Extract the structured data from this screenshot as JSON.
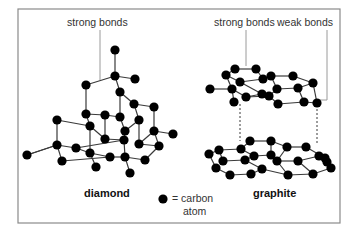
{
  "labels": {
    "diamond_strong_bonds": "strong bonds",
    "graphite_strong_bonds": "strong bonds",
    "graphite_weak_bonds": "weak bonds",
    "diamond_title": "diamond",
    "graphite_title": "graphite",
    "legend_line1": "= carbon",
    "legend_line2": "atom"
  },
  "colors": {
    "atom": "#000000",
    "bond": "#3a3a3a",
    "frame": "#8a8a8a",
    "leader": "#9a9a9a"
  },
  "frame": {
    "x": 18,
    "y": 9,
    "w": 322,
    "h": 214
  },
  "diamond": {
    "atoms": [
      [
        115,
        50
      ],
      [
        115,
        76
      ],
      [
        135,
        79
      ],
      [
        86,
        85
      ],
      [
        120,
        92
      ],
      [
        134,
        104
      ],
      [
        154,
        107
      ],
      [
        57,
        120
      ],
      [
        86,
        114
      ],
      [
        105,
        115
      ],
      [
        120,
        117
      ],
      [
        139,
        120
      ],
      [
        90,
        126
      ],
      [
        125,
        131
      ],
      [
        154,
        131
      ],
      [
        105,
        139
      ],
      [
        124,
        140
      ],
      [
        139,
        144
      ],
      [
        173,
        134
      ],
      [
        57,
        145
      ],
      [
        76,
        148
      ],
      [
        90,
        153
      ],
      [
        27,
        155
      ],
      [
        159,
        146
      ],
      [
        62,
        161
      ],
      [
        110,
        157
      ],
      [
        125,
        157
      ],
      [
        145,
        160
      ],
      [
        96,
        167
      ],
      [
        130,
        173
      ]
    ],
    "bonds": [
      [
        0,
        1
      ],
      [
        1,
        2
      ],
      [
        1,
        3
      ],
      [
        1,
        4
      ],
      [
        3,
        8
      ],
      [
        4,
        5
      ],
      [
        5,
        6
      ],
      [
        5,
        11
      ],
      [
        6,
        14
      ],
      [
        8,
        9
      ],
      [
        9,
        10
      ],
      [
        10,
        4
      ],
      [
        8,
        12
      ],
      [
        9,
        15
      ],
      [
        10,
        13
      ],
      [
        11,
        13
      ],
      [
        11,
        17
      ],
      [
        12,
        7
      ],
      [
        7,
        19
      ],
      [
        19,
        20
      ],
      [
        19,
        22
      ],
      [
        19,
        24
      ],
      [
        20,
        21
      ],
      [
        21,
        12
      ],
      [
        21,
        28
      ],
      [
        15,
        16
      ],
      [
        16,
        13
      ],
      [
        16,
        26
      ],
      [
        17,
        23
      ],
      [
        14,
        18
      ],
      [
        14,
        23
      ],
      [
        23,
        27
      ],
      [
        26,
        25
      ],
      [
        26,
        29
      ],
      [
        25,
        21
      ],
      [
        27,
        26
      ],
      [
        24,
        25
      ],
      [
        12,
        15
      ],
      [
        17,
        14
      ],
      [
        20,
        16
      ],
      [
        22,
        19
      ]
    ]
  },
  "graphite_top": {
    "atoms": [
      [
        235,
        69
      ],
      [
        256,
        69
      ],
      [
        226,
        75
      ],
      [
        240,
        82
      ],
      [
        263,
        79
      ],
      [
        271,
        76
      ],
      [
        293,
        76
      ],
      [
        210,
        89
      ],
      [
        232,
        89
      ],
      [
        277,
        89
      ],
      [
        298,
        88
      ],
      [
        313,
        83
      ],
      [
        246,
        97
      ],
      [
        269,
        96
      ],
      [
        234,
        102
      ],
      [
        278,
        104
      ],
      [
        304,
        102
      ],
      [
        317,
        103
      ],
      [
        262,
        94
      ]
    ],
    "bonds": [
      [
        0,
        1
      ],
      [
        0,
        2
      ],
      [
        1,
        4
      ],
      [
        2,
        3
      ],
      [
        3,
        4
      ],
      [
        4,
        5
      ],
      [
        5,
        6
      ],
      [
        5,
        9
      ],
      [
        6,
        11
      ],
      [
        9,
        10
      ],
      [
        10,
        11
      ],
      [
        2,
        8
      ],
      [
        7,
        8
      ],
      [
        8,
        12
      ],
      [
        3,
        18
      ],
      [
        12,
        13
      ],
      [
        13,
        9
      ],
      [
        13,
        15
      ],
      [
        10,
        16
      ],
      [
        15,
        16
      ],
      [
        16,
        17
      ],
      [
        11,
        17
      ],
      [
        8,
        14
      ],
      [
        18,
        12
      ]
    ]
  },
  "graphite_bottom": {
    "atoms": [
      [
        250,
        141
      ],
      [
        271,
        141
      ],
      [
        219,
        150
      ],
      [
        241,
        149
      ],
      [
        209,
        154
      ],
      [
        223,
        161
      ],
      [
        245,
        160
      ],
      [
        254,
        156
      ],
      [
        216,
        168
      ],
      [
        230,
        175
      ],
      [
        251,
        174
      ],
      [
        262,
        169
      ],
      [
        287,
        147
      ],
      [
        306,
        147
      ],
      [
        277,
        161
      ],
      [
        298,
        161
      ],
      [
        319,
        156
      ],
      [
        288,
        175
      ],
      [
        313,
        174
      ],
      [
        331,
        168
      ],
      [
        325,
        158
      ],
      [
        271,
        155
      ],
      [
        327,
        162
      ]
    ],
    "bonds": [
      [
        0,
        1
      ],
      [
        0,
        3
      ],
      [
        1,
        12
      ],
      [
        3,
        2
      ],
      [
        2,
        4
      ],
      [
        2,
        5
      ],
      [
        4,
        8
      ],
      [
        5,
        6
      ],
      [
        6,
        7
      ],
      [
        3,
        7
      ],
      [
        7,
        21
      ],
      [
        8,
        9
      ],
      [
        9,
        10
      ],
      [
        10,
        11
      ],
      [
        6,
        11
      ],
      [
        21,
        1
      ],
      [
        12,
        13
      ],
      [
        13,
        20
      ],
      [
        21,
        14
      ],
      [
        14,
        15
      ],
      [
        15,
        16
      ],
      [
        12,
        14
      ],
      [
        11,
        17
      ],
      [
        17,
        18
      ],
      [
        18,
        19
      ],
      [
        15,
        18
      ],
      [
        20,
        16
      ],
      [
        16,
        19
      ],
      [
        14,
        17
      ]
    ]
  },
  "graphite_dashes": [
    {
      "x": 240,
      "y1": 104,
      "y2": 141
    },
    {
      "x": 317,
      "y1": 105,
      "y2": 143
    }
  ],
  "legend": {
    "atom_x": 163,
    "atom_y": 199
  }
}
